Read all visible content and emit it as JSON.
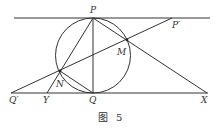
{
  "figure": {
    "caption_prefix": "图",
    "caption_number": "5",
    "stroke_color": "#333333"
  },
  "points": {
    "P": {
      "label": "P",
      "x": 93,
      "y": 18
    },
    "P_prime": {
      "label": "P′",
      "x": 172,
      "y": 18
    },
    "M": {
      "label": "M",
      "x": 127,
      "y": 40
    },
    "N": {
      "label": "N",
      "x": 60,
      "y": 71
    },
    "Q": {
      "label": "Q",
      "x": 93,
      "y": 93
    },
    "Q_prime": {
      "label": "Q′",
      "x": 11,
      "y": 93
    },
    "Y": {
      "label": "Y",
      "x": 47,
      "y": 93
    },
    "X": {
      "label": "X",
      "x": 207,
      "y": 93
    }
  },
  "circle": {
    "cx": 93,
    "cy": 55.5,
    "r": 37.5
  },
  "lines": [
    {
      "name": "top-tangent-line",
      "from": [
        14,
        18
      ],
      "to": [
        210,
        18
      ]
    },
    {
      "name": "bottom-tangent-line",
      "from": [
        11,
        93
      ],
      "to": [
        208,
        93
      ]
    },
    {
      "name": "segment-PQ",
      "from": [
        "P"
      ],
      "to": [
        "Q"
      ]
    },
    {
      "name": "segment-PX",
      "from": [
        "P"
      ],
      "to": [
        "X"
      ]
    },
    {
      "name": "segment-PY",
      "from": [
        "P"
      ],
      "to": [
        "Y"
      ]
    },
    {
      "name": "line-Qprime-Pprime",
      "from": [
        "Q_prime"
      ],
      "to": [
        "P_prime"
      ]
    },
    {
      "name": "segment-NQ",
      "from": [
        "N"
      ],
      "to": [
        "Q"
      ]
    }
  ]
}
